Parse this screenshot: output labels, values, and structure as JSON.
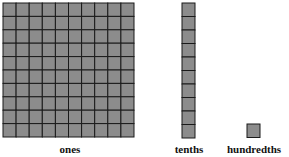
{
  "blocks": [
    {
      "name": "ones",
      "label": "ones",
      "rows": 10,
      "cols": 10
    },
    {
      "name": "tenths",
      "label": "tenths",
      "rows": 10,
      "cols": 1
    },
    {
      "name": "hundredths",
      "label": "hundredths",
      "rows": 1,
      "cols": 1
    }
  ],
  "colors": {
    "fill": "#8c8c8c",
    "line": "#1a1a1a"
  }
}
